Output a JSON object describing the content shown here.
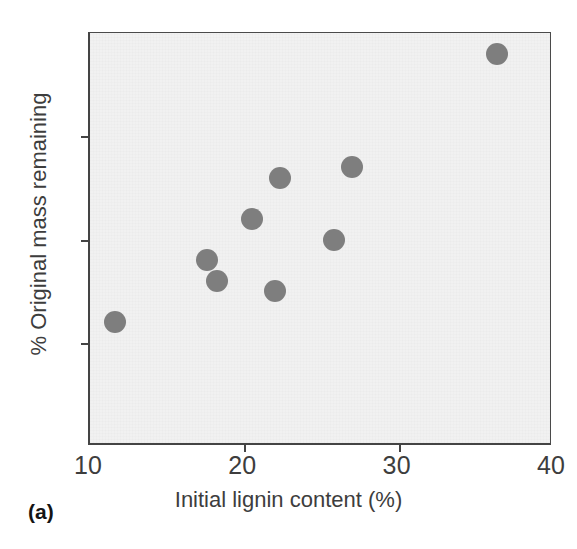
{
  "figure": {
    "panel_label": "(a)",
    "point_color": "#7e7e7e",
    "plot_background": "#f1f1f1",
    "axis_color": "#444444"
  },
  "chart_data": {
    "type": "scatter",
    "title": "",
    "xlabel": "Initial lignin content (%)",
    "ylabel": "% Original mass remaining",
    "xlim": [
      10,
      40
    ],
    "ylim": [
      30,
      70
    ],
    "xticks": [
      10,
      20,
      30,
      40
    ],
    "yticks": [
      30,
      40,
      50,
      60,
      70
    ],
    "xtick_labels": [
      "10",
      "20",
      "30",
      "40"
    ],
    "ytick_labels": [
      "30",
      "40",
      "50",
      "60",
      "70"
    ],
    "grid": false,
    "legend": "none",
    "marker": "filled-circle",
    "points": [
      {
        "x": 11.6,
        "y": 42
      },
      {
        "x": 17.6,
        "y": 48
      },
      {
        "x": 18.2,
        "y": 46
      },
      {
        "x": 20.5,
        "y": 52
      },
      {
        "x": 22.0,
        "y": 45
      },
      {
        "x": 22.3,
        "y": 56
      },
      {
        "x": 25.8,
        "y": 50
      },
      {
        "x": 27.0,
        "y": 57
      },
      {
        "x": 36.4,
        "y": 68
      }
    ]
  }
}
